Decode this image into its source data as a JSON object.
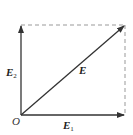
{
  "diagram": {
    "type": "vector-decomposition",
    "origin": {
      "label": "O",
      "x": 21,
      "y": 115
    },
    "vectors": [
      {
        "id": "E1",
        "label": "E",
        "subscript": "1",
        "from": [
          21,
          115
        ],
        "to": [
          125,
          115
        ],
        "label_pos": [
          63,
          129
        ]
      },
      {
        "id": "E2",
        "label": "E",
        "subscript": "2",
        "from": [
          21,
          115
        ],
        "to": [
          21,
          25
        ],
        "label_pos": [
          6,
          76
        ]
      },
      {
        "id": "E",
        "label": "E",
        "subscript": "",
        "from": [
          21,
          115
        ],
        "to": [
          125,
          25
        ],
        "label_pos": [
          79,
          74
        ]
      }
    ],
    "dashed_lines": [
      {
        "from": [
          21,
          25
        ],
        "to": [
          125,
          25
        ]
      },
      {
        "from": [
          125,
          25
        ],
        "to": [
          125,
          115
        ]
      }
    ],
    "colors": {
      "vector": "#333333",
      "dashed": "#999999",
      "label": "#222222"
    }
  }
}
